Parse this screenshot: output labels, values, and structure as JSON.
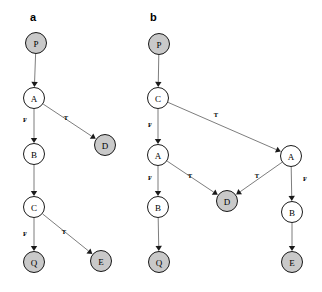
{
  "figure": {
    "width": 322,
    "height": 292,
    "background": "#ffffff",
    "node_radius": 10.5,
    "colors": {
      "terminal_fill": "#c9c9c9",
      "internal_fill": "#ffffff",
      "node_stroke": "#000000",
      "edge_stroke": "#6e6e6e",
      "arrowhead": "#1a1a1a",
      "text": "#000000"
    }
  },
  "panels": [
    {
      "id": "panel-a",
      "label": "a",
      "label_x": 30,
      "label_y": 21,
      "nodes": [
        {
          "id": "a-P",
          "label": "P",
          "x": 36,
          "y": 43,
          "kind": "terminal"
        },
        {
          "id": "a-A",
          "label": "A",
          "x": 34,
          "y": 98,
          "kind": "internal"
        },
        {
          "id": "a-D",
          "label": "D",
          "x": 105,
          "y": 145,
          "kind": "terminal"
        },
        {
          "id": "a-B",
          "label": "B",
          "x": 34,
          "y": 154,
          "kind": "internal"
        },
        {
          "id": "a-C",
          "label": "C",
          "x": 34,
          "y": 207,
          "kind": "internal"
        },
        {
          "id": "a-Q",
          "label": "Q",
          "x": 34,
          "y": 262,
          "kind": "terminal"
        },
        {
          "id": "a-E",
          "label": "E",
          "x": 101,
          "y": 261,
          "kind": "terminal"
        }
      ],
      "edges": [
        {
          "id": "a-P-A",
          "from": "a-P",
          "to": "a-A",
          "label": "",
          "label_x": 0,
          "label_y": 0
        },
        {
          "id": "a-A-B",
          "from": "a-A",
          "to": "a-B",
          "label": "F",
          "label_x": 25,
          "label_y": 119
        },
        {
          "id": "a-A-D",
          "from": "a-A",
          "to": "a-D",
          "label": "T",
          "label_x": 66,
          "label_y": 117
        },
        {
          "id": "a-B-C",
          "from": "a-B",
          "to": "a-C",
          "label": "",
          "label_x": 0,
          "label_y": 0
        },
        {
          "id": "a-C-Q",
          "from": "a-C",
          "to": "a-Q",
          "label": "F",
          "label_x": 25,
          "label_y": 233
        },
        {
          "id": "a-C-E",
          "from": "a-C",
          "to": "a-E",
          "label": "T",
          "label_x": 64,
          "label_y": 231
        }
      ]
    },
    {
      "id": "panel-b",
      "label": "b",
      "label_x": 150,
      "label_y": 21,
      "nodes": [
        {
          "id": "b-P",
          "label": "P",
          "x": 159,
          "y": 44,
          "kind": "terminal"
        },
        {
          "id": "b-C",
          "label": "C",
          "x": 158,
          "y": 98,
          "kind": "internal"
        },
        {
          "id": "b-A1",
          "label": "A",
          "x": 158,
          "y": 155,
          "kind": "internal"
        },
        {
          "id": "b-A2",
          "label": "A",
          "x": 291,
          "y": 156,
          "kind": "internal"
        },
        {
          "id": "b-B1",
          "label": "B",
          "x": 158,
          "y": 207,
          "kind": "internal"
        },
        {
          "id": "b-D",
          "label": "D",
          "x": 227,
          "y": 201,
          "kind": "terminal"
        },
        {
          "id": "b-B2",
          "label": "B",
          "x": 292,
          "y": 212,
          "kind": "internal"
        },
        {
          "id": "b-Q",
          "label": "Q",
          "x": 159,
          "y": 262,
          "kind": "terminal"
        },
        {
          "id": "b-E",
          "label": "E",
          "x": 292,
          "y": 262,
          "kind": "terminal"
        }
      ],
      "edges": [
        {
          "id": "b-P-C",
          "from": "b-P",
          "to": "b-C",
          "label": "",
          "label_x": 0,
          "label_y": 0
        },
        {
          "id": "b-C-A1",
          "from": "b-C",
          "to": "b-A1",
          "label": "F",
          "label_x": 150,
          "label_y": 124
        },
        {
          "id": "b-C-A2",
          "from": "b-C",
          "to": "b-A2",
          "label": "T",
          "label_x": 216,
          "label_y": 114
        },
        {
          "id": "b-A1-B1",
          "from": "b-A1",
          "to": "b-B1",
          "label": "F",
          "label_x": 150,
          "label_y": 177
        },
        {
          "id": "b-A1-D",
          "from": "b-A1",
          "to": "b-D",
          "label": "T",
          "label_x": 190,
          "label_y": 175
        },
        {
          "id": "b-A2-D",
          "from": "b-A2",
          "to": "b-D",
          "label": "T",
          "label_x": 257,
          "label_y": 175
        },
        {
          "id": "b-A2-B2",
          "from": "b-A2",
          "to": "b-B2",
          "label": "F",
          "label_x": 305,
          "label_y": 178
        },
        {
          "id": "b-B1-Q",
          "from": "b-B1",
          "to": "b-Q",
          "label": "",
          "label_x": 0,
          "label_y": 0
        },
        {
          "id": "b-B2-E",
          "from": "b-B2",
          "to": "b-E",
          "label": "",
          "label_x": 0,
          "label_y": 0
        }
      ]
    }
  ]
}
